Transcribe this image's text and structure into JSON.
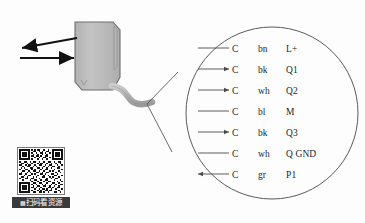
{
  "diagram": {
    "background_color": "#fdfdfd",
    "line_color": "#4a4a4a",
    "device": {
      "name": "sensor-body",
      "fill_color": "#bdbdbd",
      "edge_color": "#6e6e6e",
      "cable_color": "#b5b5b5"
    },
    "beam_arrows": [
      {
        "name": "received-beam-arrow",
        "direction": "left"
      },
      {
        "name": "emitted-beam-arrow",
        "direction": "right"
      }
    ],
    "callout": {
      "shape": "circle",
      "stroke_color": "#5a5a5a",
      "leader_lines": 2
    }
  },
  "wiring": {
    "columns": [
      "terminal",
      "color",
      "signal"
    ],
    "rows": [
      {
        "arrow": "none",
        "terminal": "C",
        "color": "bn",
        "signal": "L+"
      },
      {
        "arrow": "right",
        "terminal": "C",
        "color": "bk",
        "signal": "Q1"
      },
      {
        "arrow": "right",
        "terminal": "C",
        "color": "wh",
        "signal": "Q2"
      },
      {
        "arrow": "none",
        "terminal": "C",
        "color": "bl",
        "signal": "M"
      },
      {
        "arrow": "right",
        "terminal": "C",
        "color": "bk",
        "signal": "Q3"
      },
      {
        "arrow": "none",
        "terminal": "C",
        "color": "wh",
        "signal": "Q GND"
      },
      {
        "arrow": "left",
        "terminal": "C",
        "color": "gr",
        "signal": "P1"
      }
    ]
  },
  "qr": {
    "caption": "扫码看资源",
    "scan_glyph": "▩",
    "caption_bg": "#3a3a3a",
    "caption_fg": "#ffffff"
  }
}
